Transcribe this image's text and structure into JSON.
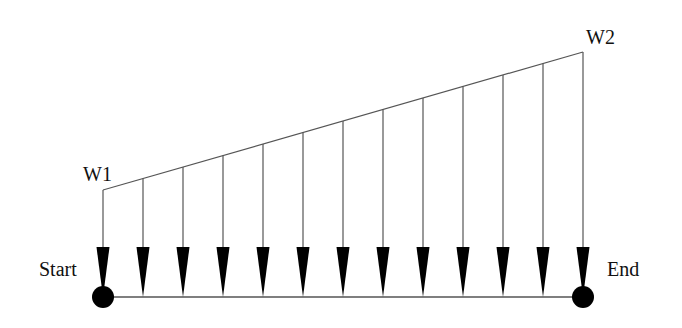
{
  "diagram": {
    "labels": {
      "w1": "W1",
      "w2": "W2",
      "start": "Start",
      "end": "End"
    },
    "colors": {
      "ink": "#000000",
      "line": "#555555",
      "background": "#ffffff"
    },
    "beam": {
      "x_start": 103,
      "x_end": 583,
      "y": 297
    },
    "load": {
      "w1_height_y": 190,
      "w2_height_y": 52,
      "arrow_count": 13,
      "arrow_spacing": 40
    },
    "supports": [
      {
        "name": "start-node",
        "x": 103,
        "y": 297,
        "r": 11
      },
      {
        "name": "end-node",
        "x": 583,
        "y": 297,
        "r": 11
      }
    ]
  }
}
